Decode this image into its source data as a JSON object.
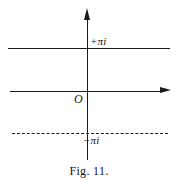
{
  "figure": {
    "caption": "Fig. 11.",
    "labels": {
      "upper_boundary": "+πi",
      "lower_boundary": "−πi",
      "origin": "O"
    },
    "colors": {
      "ink": "#1b1b1b",
      "background": "#ffffff"
    }
  },
  "chart_data": {
    "type": "line",
    "title": "Fig. 11.",
    "subtitle": "",
    "xlabel": "",
    "ylabel": "",
    "grid": false,
    "legend": "none",
    "axes": {
      "real_axis": {
        "label": "",
        "y_value": 0,
        "style": "solid-arrow",
        "direction": "right"
      },
      "imaginary_axis": {
        "label": "",
        "x_value": 0,
        "style": "solid-arrow",
        "direction": "up"
      },
      "origin_label": "O"
    },
    "series": [
      {
        "name": "+πi",
        "type": "horizontal-line",
        "style": "solid",
        "y": 3.14159,
        "label": "+πi",
        "x": [
          -5.2,
          5.2
        ],
        "values": [
          3.14159,
          3.14159
        ]
      },
      {
        "name": "real-axis",
        "type": "horizontal-line",
        "style": "solid",
        "y": 0,
        "label": "",
        "x": [
          -5.0,
          5.0
        ],
        "values": [
          0,
          0
        ]
      },
      {
        "name": "−πi",
        "type": "horizontal-line",
        "style": "dashed",
        "y": -3.14159,
        "label": "−πi",
        "x": [
          -5.0,
          5.0
        ],
        "values": [
          -3.14159,
          -3.14159
        ]
      }
    ],
    "xlim": [
      -5.5,
      5.5
    ],
    "ylim": [
      -4.6,
      4.6
    ],
    "annotations": [
      {
        "text": "+πi",
        "x": 0.15,
        "y": 3.5
      },
      {
        "text": "−πi",
        "x": -0.2,
        "y": -3.6
      },
      {
        "text": "O",
        "x": -0.45,
        "y": -0.55
      }
    ]
  }
}
